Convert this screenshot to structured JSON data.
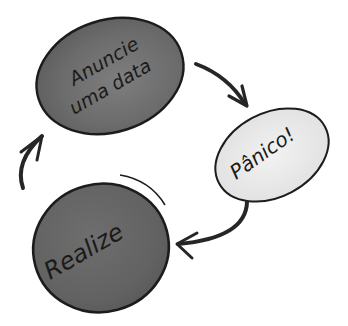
{
  "diagram": {
    "type": "cycle",
    "nodes": [
      {
        "id": "announce",
        "label_line1": "Anuncie",
        "label_line2": "uma data",
        "fill": "#6f6f6f",
        "stroke": "#1c1c1c"
      },
      {
        "id": "panic",
        "label": "Pânico!",
        "fill": "#e9e9e9",
        "stroke": "#1c1c1c"
      },
      {
        "id": "realize",
        "label": "Realize",
        "fill": "#676767",
        "stroke": "#1c1c1c"
      }
    ],
    "edges": [
      {
        "from": "announce",
        "to": "panic"
      },
      {
        "from": "panic",
        "to": "realize"
      },
      {
        "from": "realize",
        "to": "announce"
      }
    ],
    "colors": {
      "arrow": "#262626",
      "background": "#ffffff"
    }
  }
}
